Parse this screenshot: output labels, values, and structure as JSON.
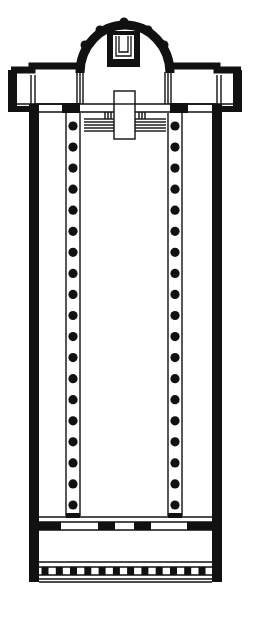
{
  "diagram": {
    "type": "architectural-floor-plan",
    "colors": {
      "ink": "#111111",
      "paper": "#ffffff"
    },
    "parts": {
      "apse": {
        "label": "apse",
        "buttress_bumps": 7
      },
      "transept": {
        "label": "transept"
      },
      "nave": {
        "label": "nave"
      },
      "aisles": {
        "label": "side aisles",
        "count": 2
      },
      "colonnades": {
        "label": "colonnades",
        "rows": 2,
        "columns_per_row": 19
      },
      "narthex": {
        "label": "narthex"
      },
      "atrium_edge": {
        "label": "entrance colonnade",
        "piers": 12
      },
      "altar": {
        "label": "altar"
      }
    }
  }
}
